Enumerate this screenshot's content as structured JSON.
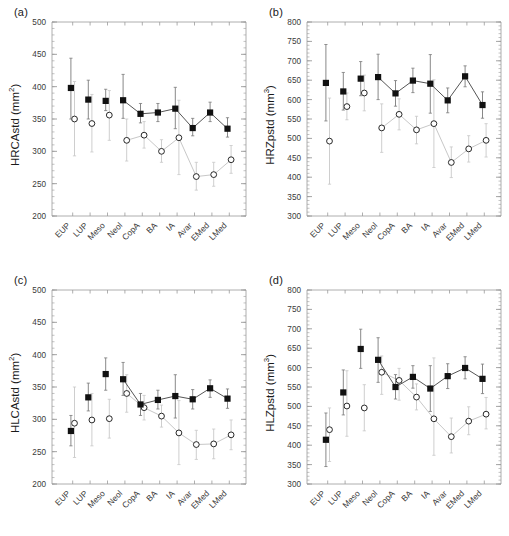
{
  "figure": {
    "background": "#ffffff",
    "categories": [
      "EUP",
      "LUP",
      "Meso",
      "Neol",
      "CopA",
      "BA",
      "IA",
      "Avar",
      "EMed",
      "LMed"
    ],
    "series_names": [
      "filled-square",
      "open-circle"
    ],
    "colors": {
      "filled_marker": "#111111",
      "open_marker": "#111111",
      "filled_line": "#555555",
      "open_line": "#c8c8c8",
      "filled_error": "#7a7a7a",
      "open_error": "#c8c8c8",
      "axis": "#9a9a9a",
      "text": "#1a1a1a"
    }
  },
  "panels": [
    {
      "id": "panel-a",
      "label": "(a)",
      "ylabel_main": "HRCAstd (mm",
      "ylabel_sup": "2",
      "ylabel_close": ")",
      "ylabel_full": "HRCAstd (mm2)"
    },
    {
      "id": "panel-b",
      "label": "(b)",
      "ylabel_main": "HRZpstd (mm",
      "ylabel_sup": "3",
      "ylabel_close": ")",
      "ylabel_full": "HRZpstd (mm3)"
    },
    {
      "id": "panel-c",
      "label": "(c)",
      "ylabel_main": "HLCAstd (mm",
      "ylabel_sup": "2",
      "ylabel_close": ")",
      "ylabel_full": "HLCAstd (mm2)"
    },
    {
      "id": "panel-d",
      "label": "(d)",
      "ylabel_main": "HLZpstd (mm",
      "ylabel_sup": "3",
      "ylabel_close": ")",
      "ylabel_full": "HLZpstd (mm3)"
    }
  ],
  "chart_data": [
    {
      "panel": "a",
      "type": "scatter",
      "title": "(a)",
      "xlabel": "",
      "ylabel": "HRCAstd (mm2)",
      "ylim": [
        200,
        500
      ],
      "yticks": [
        200,
        250,
        300,
        350,
        400,
        450,
        500
      ],
      "minor_tick_step": 10,
      "grid": false,
      "categories": [
        "EUP",
        "LUP",
        "Meso",
        "Neol",
        "CopA",
        "BA",
        "IA",
        "Avar",
        "EMed",
        "LMed"
      ],
      "series": [
        {
          "name": "filled-square",
          "marker": "square-filled",
          "values": [
            398,
            380,
            378,
            379,
            358,
            360,
            366,
            336,
            360,
            335
          ],
          "err_low": [
            350,
            350,
            363,
            351,
            344,
            346,
            335,
            324,
            346,
            322
          ],
          "err_high": [
            444,
            410,
            396,
            419,
            374,
            374,
            399,
            351,
            376,
            352
          ]
        },
        {
          "name": "open-circle",
          "marker": "circle-open",
          "values": [
            350,
            343,
            356,
            317,
            325,
            300,
            321,
            261,
            264,
            287
          ],
          "err_low": [
            293,
            299,
            317,
            285,
            305,
            283,
            264,
            240,
            246,
            266
          ],
          "err_high": [
            408,
            388,
            394,
            350,
            346,
            318,
            379,
            283,
            283,
            309
          ]
        }
      ]
    },
    {
      "panel": "b",
      "type": "scatter",
      "title": "(b)",
      "xlabel": "",
      "ylabel": "HRZpstd (mm3)",
      "ylim": [
        300,
        800
      ],
      "yticks": [
        300,
        350,
        400,
        450,
        500,
        550,
        600,
        650,
        700,
        750,
        800
      ],
      "minor_tick_step": 10,
      "grid": false,
      "categories": [
        "EUP",
        "LUP",
        "Meso",
        "Neol",
        "CopA",
        "BA",
        "IA",
        "Avar",
        "EMed",
        "LMed"
      ],
      "series": [
        {
          "name": "filled-square",
          "marker": "square-filled",
          "values": [
            643,
            621,
            654,
            658,
            616,
            649,
            641,
            598,
            660,
            586
          ],
          "err_low": [
            545,
            573,
            610,
            600,
            583,
            618,
            565,
            566,
            633,
            552
          ],
          "err_high": [
            742,
            670,
            698,
            717,
            649,
            681,
            716,
            630,
            687,
            620
          ]
        },
        {
          "name": "open-circle",
          "marker": "circle-open",
          "values": [
            493,
            582,
            617,
            527,
            562,
            522,
            538,
            438,
            473,
            495
          ],
          "err_low": [
            382,
            548,
            571,
            464,
            522,
            486,
            425,
            399,
            439,
            452
          ],
          "err_high": [
            604,
            617,
            663,
            589,
            602,
            557,
            651,
            478,
            507,
            538
          ]
        }
      ]
    },
    {
      "panel": "c",
      "type": "scatter",
      "title": "(c)",
      "xlabel": "",
      "ylabel": "HLCAstd (mm2)",
      "ylim": [
        200,
        500
      ],
      "yticks": [
        200,
        250,
        300,
        350,
        400,
        450,
        500
      ],
      "minor_tick_step": 10,
      "grid": false,
      "categories": [
        "EUP",
        "LUP",
        "Meso",
        "Neol",
        "CopA",
        "BA",
        "IA",
        "Avar",
        "EMed",
        "LMed"
      ],
      "series": [
        {
          "name": "filled-square",
          "marker": "square-filled",
          "values": [
            282,
            334,
            370,
            362,
            323,
            330,
            336,
            331,
            348,
            332
          ],
          "err_low": [
            259,
            313,
            345,
            337,
            306,
            316,
            302,
            316,
            334,
            317
          ],
          "err_high": [
            306,
            356,
            395,
            388,
            340,
            345,
            369,
            346,
            361,
            347
          ]
        },
        {
          "name": "open-circle",
          "marker": "circle-open",
          "values": [
            294,
            299,
            301,
            340,
            318,
            305,
            279,
            261,
            262,
            276
          ],
          "err_low": [
            241,
            259,
            271,
            311,
            299,
            288,
            230,
            238,
            239,
            253
          ],
          "err_high": [
            350,
            340,
            331,
            369,
            337,
            322,
            329,
            283,
            285,
            299
          ]
        }
      ]
    },
    {
      "panel": "d",
      "type": "scatter",
      "title": "(d)",
      "xlabel": "",
      "ylabel": "HLZpstd (mm3)",
      "ylim": [
        300,
        800
      ],
      "yticks": [
        300,
        350,
        400,
        450,
        500,
        550,
        600,
        650,
        700,
        750,
        800
      ],
      "minor_tick_step": 10,
      "grid": false,
      "categories": [
        "EUP",
        "LUP",
        "Meso",
        "Neol",
        "CopA",
        "BA",
        "IA",
        "Avar",
        "EMed",
        "LMed"
      ],
      "series": [
        {
          "name": "filled-square",
          "marker": "square-filled",
          "values": [
            414,
            536,
            648,
            620,
            550,
            576,
            546,
            578,
            599,
            571
          ],
          "err_low": [
            345,
            478,
            598,
            562,
            519,
            547,
            487,
            546,
            571,
            533
          ],
          "err_high": [
            483,
            594,
            699,
            677,
            582,
            605,
            605,
            610,
            628,
            609
          ]
        },
        {
          "name": "open-circle",
          "marker": "circle-open",
          "values": [
            440,
            501,
            496,
            588,
            567,
            524,
            468,
            422,
            462,
            480
          ],
          "err_low": [
            358,
            423,
            437,
            531,
            516,
            491,
            374,
            380,
            427,
            442
          ],
          "err_high": [
            496,
            592,
            556,
            630,
            598,
            558,
            625,
            470,
            499,
            523
          ]
        }
      ]
    }
  ]
}
